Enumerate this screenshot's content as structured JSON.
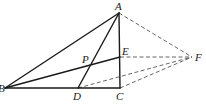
{
  "diagram": {
    "type": "geometry",
    "points": {
      "A": {
        "x": 119,
        "y": 13,
        "label": "A",
        "lx": 115,
        "ly": 10
      },
      "B": {
        "x": 5,
        "y": 88,
        "label": "B",
        "lx": -2,
        "ly": 92
      },
      "C": {
        "x": 120,
        "y": 88,
        "label": "C",
        "lx": 116,
        "ly": 100
      },
      "D": {
        "x": 78,
        "y": 88,
        "label": "D",
        "lx": 73,
        "ly": 100
      },
      "E": {
        "x": 120,
        "y": 57,
        "label": "E",
        "lx": 122,
        "ly": 55
      },
      "F": {
        "x": 192,
        "y": 57,
        "label": "F",
        "lx": 195,
        "ly": 61
      },
      "P": {
        "x": 88,
        "y": 65,
        "label": "P",
        "lx": 82,
        "ly": 63
      }
    },
    "solid_segments": [
      [
        "A",
        "B"
      ],
      [
        "A",
        "C"
      ],
      [
        "A",
        "D"
      ],
      [
        "B",
        "C"
      ],
      [
        "B",
        "E"
      ]
    ],
    "dashed_segments": [
      [
        "A",
        "F"
      ],
      [
        "E",
        "F"
      ],
      [
        "D",
        "F"
      ],
      [
        "C",
        "F"
      ]
    ],
    "colors": {
      "solid": "#1a1a1a",
      "dashed": "#555555",
      "background": "#ffffff"
    }
  }
}
